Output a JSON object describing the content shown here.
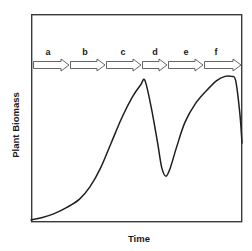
{
  "figure": {
    "kind": "line-diagram",
    "background_color": "#ffffff",
    "frame": {
      "stroke_color": "#3a3a3a",
      "x": 31,
      "y": 14,
      "width": 211,
      "height": 208
    },
    "axis_titles": {
      "y": "Plant Biomass",
      "x": "Time"
    },
    "phase_band": {
      "description": "Six sequential open-outline arrows spanning the top of the plot area, each labelled with a lowercase letter.",
      "arrow_color": "#4a4a4a",
      "arrow_fill": "#ffffff",
      "baseline_y": 65,
      "label_y": 55,
      "arrows": [
        {
          "label": "a",
          "x_start": 33,
          "x_end": 69,
          "label_x": 48
        },
        {
          "label": "b",
          "x_start": 70,
          "x_end": 105,
          "label_x": 85
        },
        {
          "label": "c",
          "x_start": 106,
          "x_end": 141,
          "label_x": 123
        },
        {
          "label": "d",
          "x_start": 142,
          "x_end": 167,
          "label_x": 155
        },
        {
          "label": "e",
          "x_start": 168,
          "x_end": 203,
          "label_x": 186
        },
        {
          "label": "f",
          "x_start": 204,
          "x_end": 241,
          "label_x": 216
        }
      ]
    }
  },
  "chart_data": {
    "type": "line",
    "title": "",
    "xlabel": "Time",
    "ylabel": "Plant Biomass",
    "grid": false,
    "legend": null,
    "axis_ticks": {
      "x": [],
      "y": []
    },
    "xlim": [
      0,
      100
    ],
    "ylim": [
      0,
      100
    ],
    "annotations": [
      {
        "text": "a",
        "x": 8,
        "y": 76,
        "type": "phase-arrow-label"
      },
      {
        "text": "b",
        "x": 26,
        "y": 76,
        "type": "phase-arrow-label"
      },
      {
        "text": "c",
        "x": 44,
        "y": 76,
        "type": "phase-arrow-label"
      },
      {
        "text": "d",
        "x": 59,
        "y": 76,
        "type": "phase-arrow-label"
      },
      {
        "text": "e",
        "x": 73,
        "y": 76,
        "type": "phase-arrow-label"
      },
      {
        "text": "f",
        "x": 88,
        "y": 76,
        "type": "phase-arrow-label"
      }
    ],
    "series": [
      {
        "name": "Plant Biomass",
        "color": "#1f1f1f",
        "x": [
          0,
          5,
          11,
          17,
          23,
          28,
          33,
          38,
          43,
          48,
          52,
          54,
          57,
          60,
          62,
          64,
          66,
          69,
          73,
          78,
          83,
          88,
          92,
          95,
          97,
          99,
          100
        ],
        "y": [
          1,
          2,
          4,
          7,
          11,
          17,
          26,
          38,
          50,
          60,
          66,
          68,
          55,
          38,
          26,
          22,
          26,
          36,
          48,
          57,
          63,
          68,
          70,
          70,
          68,
          52,
          38
        ]
      }
    ]
  }
}
